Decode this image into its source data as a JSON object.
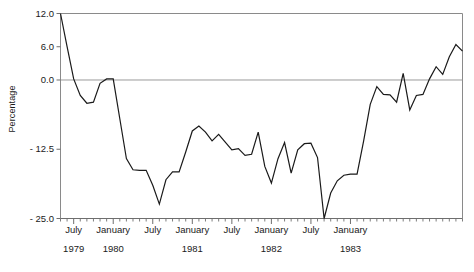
{
  "chart_data": {
    "type": "line",
    "title": "",
    "xlabel": "",
    "ylabel": "Percentage",
    "ylim": [
      -25.0,
      12.0
    ],
    "yticks": [
      12.0,
      6.0,
      0.0,
      -12.5,
      -25.0
    ],
    "ytick_labels": [
      "12.0",
      "6.0",
      "0.0",
      "- 12.5",
      "- 25.0"
    ],
    "grid": false,
    "legend": "none",
    "zero_line": true,
    "x_axis_type": "monthly",
    "x_start": "1979-05",
    "x_end": "1983-07",
    "xtick_months": [
      {
        "label": "July",
        "year": "1979",
        "index": 2
      },
      {
        "label": "January",
        "year": "1980",
        "index": 8
      },
      {
        "label": "July",
        "year": "",
        "index": 14
      },
      {
        "label": "January",
        "year": "1981",
        "index": 20
      },
      {
        "label": "July",
        "year": "",
        "index": 26
      },
      {
        "label": "January",
        "year": "1982",
        "index": 32
      },
      {
        "label": "July",
        "year": "",
        "index": 38
      },
      {
        "label": "January",
        "year": "1983",
        "index": 44
      }
    ],
    "series": [
      {
        "name": "Percentage change",
        "color": "#1a1a1a",
        "values": [
          12.0,
          6.0,
          0.2,
          -2.8,
          -4.2,
          -4.0,
          -0.6,
          0.2,
          0.2,
          -7.0,
          -14.2,
          -16.2,
          -16.3,
          -16.3,
          -19.0,
          -22.4,
          -18.0,
          -16.6,
          -16.6,
          -13.0,
          -9.2,
          -8.3,
          -9.4,
          -11.0,
          -9.8,
          -11.2,
          -12.6,
          -12.4,
          -13.6,
          -13.4,
          -9.4,
          -15.6,
          -18.6,
          -14.2,
          -11.3,
          -16.8,
          -12.6,
          -11.5,
          -11.4,
          -14.0,
          -25.0,
          -20.4,
          -18.2,
          -17.2,
          -17.0,
          -17.0,
          -11.0,
          -4.4,
          -1.2,
          -2.6,
          -2.7,
          -4.0,
          1.2,
          -5.4,
          -2.8,
          -2.6,
          0.2,
          2.4,
          1.0,
          4.2,
          6.4,
          5.2
        ]
      }
    ]
  },
  "axis": {
    "yticks": [
      {
        "label": "12.0",
        "value": 12.0
      },
      {
        "label": "6.0",
        "value": 6.0
      },
      {
        "label": "0.0",
        "value": 0.0
      },
      {
        "label": "- 12.5",
        "value": -12.5
      },
      {
        "label": "- 25.0",
        "value": -25.0
      }
    ]
  },
  "colors": {
    "line": "#1a1a1a",
    "axis": "#8a8a8a",
    "zero_line": "#9a9a9a",
    "background": "#ffffff"
  }
}
